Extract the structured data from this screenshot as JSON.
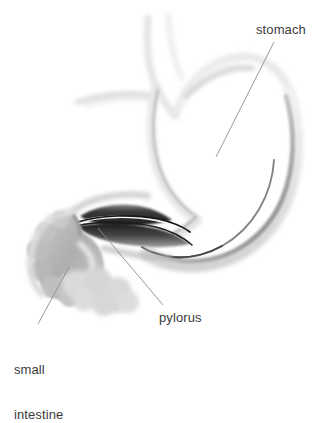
{
  "image": {
    "kind": "anatomical-illustration",
    "subject": "stomach-pylorus-small-intestine",
    "width": 328,
    "height": 374,
    "background_color": "#ffffff",
    "style": "grayscale airbrushed medical illustration"
  },
  "palette": {
    "background": "#ffffff",
    "label_text": "#3b3b3b",
    "leader_line": "#8c8c8c",
    "stomach_outline_light": "#e8e8e8",
    "stomach_outline_mid": "#cfcfcf",
    "stomach_outline_dark": "#9a9a9a",
    "greater_curvature_edge": "#5a5a5a",
    "pylorus_dark": "#262626",
    "pylorus_mid": "#4f4f4f",
    "pylorus_light": "#8a8a8a",
    "duodenum_mid": "#b2b2b2",
    "duodenum_light": "#d6d6d6",
    "jejunum_light": "#dcdcdc"
  },
  "labels": [
    {
      "id": "stomach",
      "text": "stomach",
      "lines": [
        "stomach"
      ],
      "x": 256,
      "y": 22,
      "leader": {
        "x1": 274,
        "y1": 42,
        "x2": 216,
        "y2": 157
      }
    },
    {
      "id": "pylorus",
      "text": "pylorus",
      "lines": [
        "pylorus"
      ],
      "x": 159,
      "y": 310,
      "leader": {
        "x1": 98,
        "y1": 228,
        "x2": 163,
        "y2": 305
      }
    },
    {
      "id": "small-intestine",
      "text": "small intestine",
      "lines": [
        "small",
        "intestine"
      ],
      "x": 14,
      "y": 332,
      "leader": {
        "x1": 69,
        "y1": 267,
        "x2": 38,
        "y2": 324
      }
    }
  ],
  "structures": [
    {
      "id": "esophagus",
      "name": "esophagus",
      "tone": "very light gray"
    },
    {
      "id": "fundus",
      "name": "fundus",
      "tone": "very light gray"
    },
    {
      "id": "stomach-body",
      "name": "stomach body",
      "tone": "light gray outline"
    },
    {
      "id": "lesser-curvature",
      "name": "lesser curvature",
      "tone": "light gray band"
    },
    {
      "id": "greater-curvature",
      "name": "greater curvature",
      "tone": "gray with dark inner edge"
    },
    {
      "id": "antrum",
      "name": "antrum",
      "tone": "light gray"
    },
    {
      "id": "pylorus",
      "name": "pylorus",
      "tone": "dark near-black wedge"
    },
    {
      "id": "duodenum",
      "name": "duodenum",
      "tone": "medium gray lobed loop"
    },
    {
      "id": "jejunum",
      "name": "jejunum loops",
      "tone": "light gray lobes"
    }
  ]
}
